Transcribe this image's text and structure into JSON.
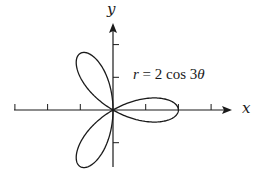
{
  "chart_data": {
    "type": "line",
    "subtype": "polar",
    "title": "",
    "equation": "r = 2 cos 3θ",
    "equation_parts": {
      "r": "r",
      "rest": " = 2 cos 3",
      "theta": "θ"
    },
    "function": {
      "r": "2*cos(3*theta)",
      "theta_range": [
        0,
        3.14159
      ]
    },
    "xlabel": "x",
    "ylabel": "y",
    "xlim": [
      -3,
      3.6
    ],
    "ylim": [
      -1.7,
      2.7
    ],
    "x_ticks": [
      -3,
      -2,
      -1,
      1,
      2,
      3
    ],
    "y_ticks": [
      -1,
      1,
      2
    ],
    "tick_labels_shown": false,
    "grid": false,
    "petals": 3,
    "petal_tips": [
      {
        "angle_deg": 0,
        "x": 2,
        "y": 0
      },
      {
        "angle_deg": 120,
        "x": -1,
        "y": 1.732
      },
      {
        "angle_deg": 240,
        "x": -1,
        "y": -1.732
      }
    ],
    "legend": null
  },
  "layout": {
    "origin_px": [
      113,
      110
    ],
    "unit_px": 32.7,
    "x_axis_px": [
      14,
      232
    ],
    "y_axis_px": [
      167,
      23
    ]
  }
}
